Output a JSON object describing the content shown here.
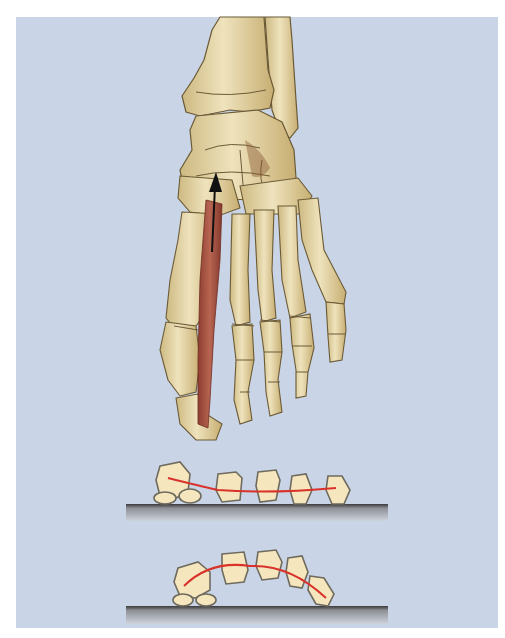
{
  "figure": {
    "colors": {
      "background": "#c9d5e6",
      "bone_fill": "#e3d3a6",
      "bone_shade": "#b89c63",
      "bone_outline": "#6b5a36",
      "muscle": "#a4513f",
      "arrow": "#111111",
      "arch_line": "#d8322a",
      "schematic_bone_fill": "#f6e6bd",
      "schematic_outline": "#6f6a5e",
      "ground_top": "#3d3d3d",
      "ground_bottom": "#c7cbd2"
    },
    "diagrams": [
      {
        "name": "flattened-arch",
        "label": ""
      },
      {
        "name": "raised-arch",
        "label": ""
      }
    ]
  }
}
